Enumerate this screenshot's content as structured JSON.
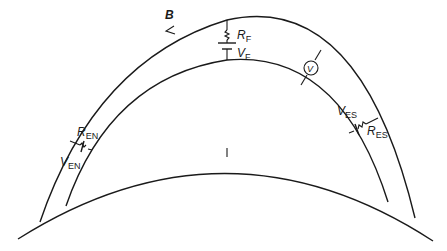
{
  "figure": {
    "type": "equivalent-circuit diagram (ionosphere current loops over Earth surface)",
    "labels": {
      "field_line": "B",
      "r_f": {
        "main": "R",
        "sub": "F"
      },
      "v_f": {
        "main": "V",
        "sub": "F"
      },
      "voltmeter": "V",
      "r_en": {
        "main": "R",
        "sub": "EN"
      },
      "v_en": {
        "main": "V",
        "sub": "EN"
      },
      "r_es": {
        "main": "R",
        "sub": "ES"
      },
      "v_es": {
        "main": "V",
        "sub": "ES"
      }
    },
    "colors": {
      "ink": "#1a1a1a",
      "background": "#ffffff"
    }
  }
}
